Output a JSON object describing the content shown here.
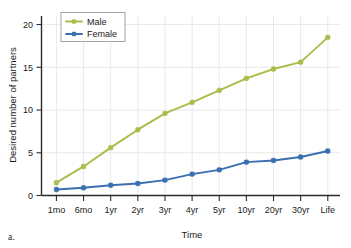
{
  "panel": {
    "label": "a."
  },
  "chart_data": {
    "type": "line",
    "title": "",
    "xlabel": "Time",
    "ylabel": "Desired number of partners",
    "categories": [
      "1mo",
      "6mo",
      "1yr",
      "2yr",
      "3yr",
      "4yr",
      "5yr",
      "10yr",
      "20yr",
      "30yr",
      "Life"
    ],
    "yticks": [
      0,
      5,
      10,
      15,
      20
    ],
    "ytick_labels": [
      "0",
      "5",
      "10",
      "15",
      "20"
    ],
    "ylim": [
      0,
      21
    ],
    "grid": true,
    "legend_position": "top-left",
    "series": [
      {
        "name": "Male",
        "color": "#a6be4a",
        "values": [
          1.5,
          3.4,
          5.6,
          7.7,
          9.6,
          10.9,
          12.3,
          13.7,
          14.8,
          15.6,
          18.5
        ]
      },
      {
        "name": "Female",
        "color": "#3a6fb0",
        "values": [
          0.7,
          0.9,
          1.2,
          1.4,
          1.8,
          2.5,
          3.0,
          3.9,
          4.1,
          4.5,
          5.2
        ]
      }
    ]
  }
}
